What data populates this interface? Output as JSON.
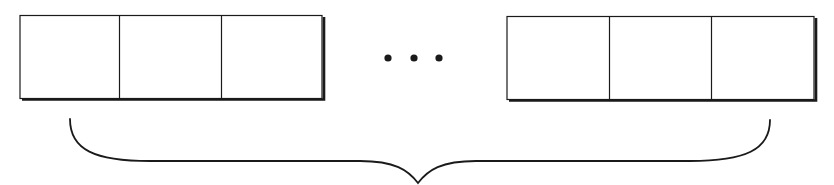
{
  "diagram": {
    "type": "array-of-cells-with-brace",
    "stroke_color": "#1a1a1a",
    "background": "#ffffff",
    "left_group": {
      "cells": [
        "",
        "",
        ""
      ]
    },
    "ellipsis": {
      "symbol": "• • •",
      "dot_count": 3
    },
    "right_group": {
      "cells": [
        "",
        "",
        ""
      ]
    },
    "brace": {
      "orientation": "horizontal-below",
      "label": ""
    }
  }
}
